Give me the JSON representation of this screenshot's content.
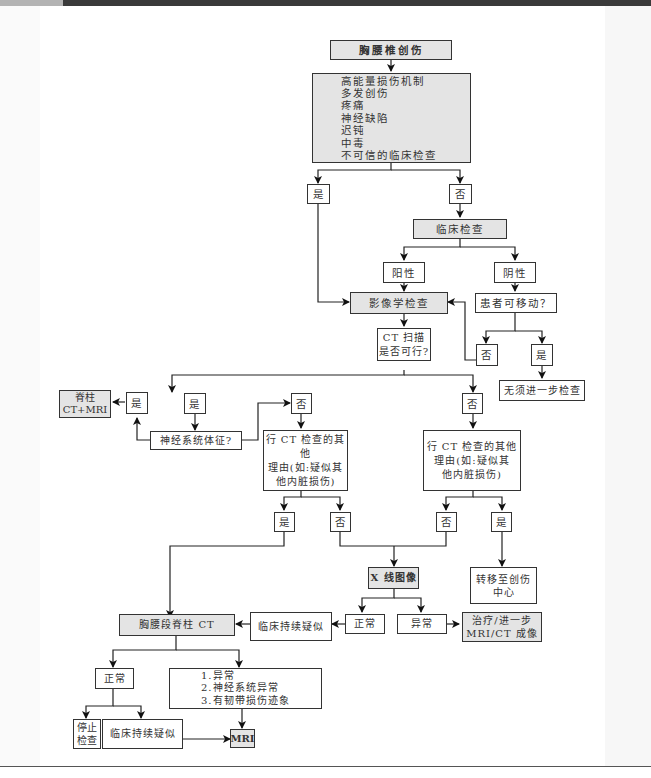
{
  "diagram": {
    "title": "胸腰椎创伤",
    "risk_factors": [
      "高能量损伤机制",
      "多发创伤",
      "疼痛",
      "神经缺陷",
      "迟钝",
      "中毒",
      "不可信的临床检查"
    ],
    "yes": "是",
    "no": "否",
    "clinical_exam": "临床检查",
    "positive": "阳性",
    "negative": "阴性",
    "patient_mobile": "患者可移动？",
    "imaging_exam": "影像学检查",
    "no_further_exam": "无须进一步检查",
    "ct_feasible": [
      "CT 扫描",
      "是否可行?"
    ],
    "neuro_signs": "神经系统体征?",
    "spine_ct_mri": [
      "脊柱",
      "CT+MRI"
    ],
    "other_ct_reason": [
      "行 CT 检查的其他",
      "理由(如:疑似其",
      "他内脏损伤)"
    ],
    "transfer_trauma_center": [
      "转移至创伤",
      "中心"
    ],
    "xray_imaging": "X 线图像",
    "normal": "正常",
    "abnormal": "异常",
    "clinical_persistent_suspicion": "临床持续疑似",
    "tl_spine_ct": "胸腰段脊柱 CT",
    "treatment_further": [
      "治疗/进一步",
      "MRI/CT 成像"
    ],
    "ct_abnormal_list": [
      "1.异常",
      "2.神经系统异常",
      "3.有韧带损伤迹象"
    ],
    "stop_exam": [
      "停止",
      "检查"
    ],
    "mri": "MRI"
  },
  "colors": {
    "line": "#222222",
    "box_border": "#333333",
    "shaded_fill": "#e4e4e4",
    "topbar_dark": "#3a3a3a",
    "topbar_light": "#b3b3b3"
  }
}
